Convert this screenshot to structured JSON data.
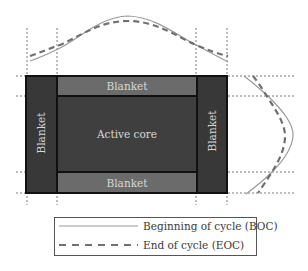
{
  "diagram": {
    "colors": {
      "background": "#ffffff",
      "active_core": "#3f3f3f",
      "side_blanket": "#383838",
      "top_bottom_blanket": "#6b6b6b",
      "border": "#111111",
      "guide_line": "#555555",
      "boc_line": "#9a9a9a",
      "eoc_line": "#707070",
      "label_text": "#d9d9d9",
      "legend_text": "#333333"
    },
    "regions": {
      "top_blanket": "Blanket",
      "bottom_blanket": "Blanket",
      "left_blanket": "Blanket",
      "right_blanket": "Blanket",
      "active_core": "Active core"
    },
    "profiles": {
      "horizontal": {
        "boc": "Solid curve peaking above core center",
        "eoc": "Dashed curve, flatter with higher edges"
      },
      "vertical": {
        "boc": "Solid curve bulging right of core center",
        "eoc": "Dashed curve, flatter with higher edges"
      }
    },
    "legend": {
      "items": [
        {
          "style": "solid",
          "label": "Beginning of cycle (BOC)"
        },
        {
          "style": "dashed",
          "label": "End of cycle (EOC)"
        }
      ]
    }
  }
}
